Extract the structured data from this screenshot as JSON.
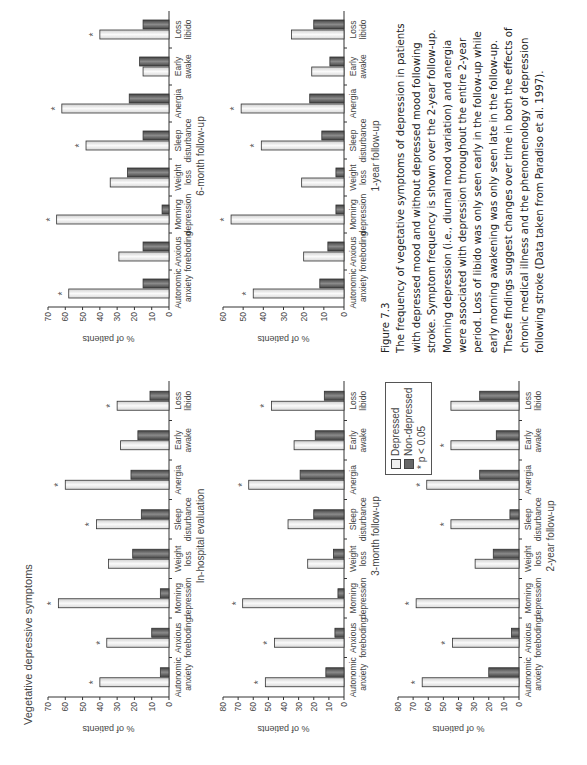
{
  "section_title": "Vegetative depressive symptoms",
  "legend": {
    "depressed": "Depressed",
    "nondepressed": "Non-depressed",
    "significance": "* p < 0.05"
  },
  "colors": {
    "depressed_fill": "#f1f1f1",
    "nondepressed_fill": "#6a6a6a",
    "bar_stroke": "#333333"
  },
  "caption": {
    "figure_label": "Figure 7.3",
    "text": "The frequency of vegetative symptoms of depression in patients with depressed mood and without depressed mood following stroke. Symptom frequency is shown over the 2-year follow-up. Morning depression (i.e., diurnal mood variation) and anergia were associated with depression throughout the entire 2-year period. Loss of libido was only seen early in the follow-up while early morning awakening was only seen late in the follow-up. These findings suggest changes over time in both the effects of chronic medical illness and the phenomenology of depression following stroke (Data taken from Paradiso et al. 1997)."
  },
  "chart_data": [
    {
      "type": "bar",
      "title": "In-hospital evaluation",
      "ylabel": "% of patients",
      "ylim": [
        0,
        70
      ],
      "yticks": [
        0,
        10,
        20,
        30,
        40,
        50,
        60,
        70
      ],
      "categories": [
        "Autonomic anxiety",
        "Anxious foreboding",
        "Morning depression",
        "Weight loss",
        "Sleep disturbance",
        "Anergia",
        "Early awake",
        "Loss libido"
      ],
      "series": [
        {
          "name": "Depressed",
          "values": [
            40,
            36,
            64,
            35,
            42,
            60,
            28,
            30
          ]
        },
        {
          "name": "Non-depressed",
          "values": [
            5,
            10,
            5,
            21,
            16,
            22,
            18,
            11
          ]
        }
      ],
      "significant": [
        true,
        true,
        true,
        false,
        true,
        true,
        false,
        true
      ],
      "grid": false
    },
    {
      "type": "bar",
      "title": "6-month follow-up",
      "ylabel": "% of patients",
      "ylim": [
        0,
        70
      ],
      "yticks": [
        0,
        10,
        20,
        30,
        40,
        50,
        60,
        70
      ],
      "categories": [
        "Autonomic anxiety",
        "Anxious foreboding",
        "Morning depression",
        "Weight loss",
        "Sleep disturbance",
        "Anergia",
        "Early awake",
        "Loss libido"
      ],
      "series": [
        {
          "name": "Depressed",
          "values": [
            58,
            29,
            65,
            34,
            48,
            62,
            15,
            40
          ]
        },
        {
          "name": "Non-depressed",
          "values": [
            15,
            15,
            4,
            24,
            15,
            23,
            17,
            15
          ]
        }
      ],
      "significant": [
        true,
        false,
        true,
        false,
        true,
        true,
        false,
        true
      ],
      "grid": false
    },
    {
      "type": "bar",
      "title": "3-month follow-up",
      "ylabel": "% of patients",
      "ylim": [
        0,
        80
      ],
      "yticks": [
        0,
        10,
        20,
        30,
        40,
        50,
        60,
        70,
        80
      ],
      "categories": [
        "Autonomic anxiety",
        "Anxious foreboding",
        "Morning depression",
        "Weight loss",
        "Sleep disturbance",
        "Anergia",
        "Early awake",
        "Loss libido"
      ],
      "series": [
        {
          "name": "Depressed",
          "values": [
            52,
            46,
            67,
            24,
            37,
            63,
            33,
            48
          ]
        },
        {
          "name": "Non-depressed",
          "values": [
            12,
            6,
            4,
            7,
            20,
            29,
            19,
            13
          ]
        }
      ],
      "significant": [
        true,
        true,
        true,
        false,
        false,
        true,
        false,
        true
      ],
      "grid": false
    },
    {
      "type": "bar",
      "title": "1-year follow-up",
      "ylabel": "% of patients",
      "ylim": [
        0,
        60
      ],
      "yticks": [
        0,
        10,
        20,
        30,
        40,
        50,
        60
      ],
      "categories": [
        "Autonomic anxiety",
        "Anxious foreboding",
        "Morning depression",
        "Weight loss",
        "Sleep disturbance",
        "Anergia",
        "Early awake",
        "Loss libido"
      ],
      "series": [
        {
          "name": "Depressed",
          "values": [
            45,
            20,
            56,
            21,
            41,
            51,
            16,
            26
          ]
        },
        {
          "name": "Non-depressed",
          "values": [
            12,
            8,
            4,
            4,
            11,
            17,
            7,
            15
          ]
        }
      ],
      "significant": [
        true,
        false,
        true,
        false,
        true,
        true,
        false,
        false
      ],
      "grid": false
    },
    {
      "type": "bar",
      "title": "2-year follow-up",
      "ylabel": "% of patients",
      "ylim": [
        0,
        80
      ],
      "yticks": [
        0,
        10,
        20,
        30,
        40,
        50,
        60,
        70,
        80
      ],
      "categories": [
        "Autonomic anxiety",
        "Anxious foreboding",
        "Morning depression",
        "Weight loss",
        "Sleep disturbance",
        "Anergia",
        "Early awake",
        "Loss libido"
      ],
      "series": [
        {
          "name": "Depressed",
          "values": [
            64,
            44,
            68,
            29,
            45,
            61,
            45,
            45
          ]
        },
        {
          "name": "Non-depressed",
          "values": [
            20,
            5,
            0,
            17,
            6,
            26,
            15,
            26
          ]
        }
      ],
      "significant": [
        true,
        true,
        true,
        false,
        true,
        true,
        true,
        false
      ],
      "grid": false
    }
  ]
}
